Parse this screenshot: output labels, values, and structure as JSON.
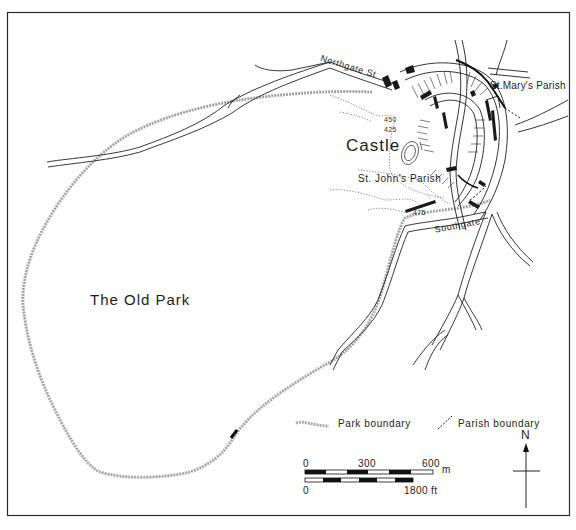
{
  "map": {
    "area_labels": {
      "old_park": "The Old Park",
      "castle": "Castle",
      "st_marys_parish": "St.Mary's Parish",
      "st_johns_parish": "St. John's Parish"
    },
    "street_labels": {
      "northgate": "Northgate St",
      "southgate": "Southgate"
    },
    "contour_labels": [
      "450",
      "425",
      "475"
    ]
  },
  "legend": {
    "items": [
      {
        "symbol": "park-boundary-stipple",
        "label": "Park boundary"
      },
      {
        "symbol": "parish-boundary-dashed",
        "label": "Parish boundary"
      }
    ]
  },
  "scale_bar": {
    "metric": {
      "ticks": [
        "0",
        "300",
        "600"
      ],
      "unit": "m"
    },
    "imperial": {
      "ticks": [
        "0",
        "1800"
      ],
      "unit": "ft",
      "end_label": "1800 ft"
    }
  },
  "north_arrow": {
    "label": "N"
  },
  "colors": {
    "ink": "#1a1a1a",
    "park_boundary": "#9a9a9a",
    "background": "#ffffff"
  }
}
